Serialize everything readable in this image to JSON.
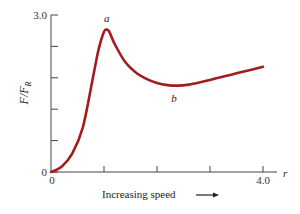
{
  "chart_data": {
    "type": "line",
    "title": "",
    "xlabel": "Increasing speed",
    "xlabel_arrow": "→",
    "x_axis_symbol": "r",
    "ylabel": "F/F_R",
    "ylabel_main": "F/F",
    "ylabel_sub": "R",
    "xlim": [
      0,
      4.0
    ],
    "ylim": [
      0,
      3.0
    ],
    "x_tick_labels": [
      "0",
      "",
      "",
      "",
      "4.0"
    ],
    "x_ticks": [
      0,
      1,
      2,
      3,
      4
    ],
    "y_tick_labels": [
      "0",
      "",
      "",
      "",
      "",
      "3.0"
    ],
    "y_ticks": [
      0,
      0.6,
      1.2,
      1.8,
      2.4,
      3.0
    ],
    "grid": false,
    "legend": null,
    "color": "#a31a1f",
    "annotations": [
      {
        "label": "a",
        "x": 1.05,
        "y": 2.72,
        "note": "peak"
      },
      {
        "label": "b",
        "x": 2.3,
        "y": 1.64,
        "note": "minimum"
      }
    ],
    "series": [
      {
        "name": "F/F_R",
        "x": [
          0,
          0.2,
          0.4,
          0.6,
          0.8,
          0.9,
          1.0,
          1.05,
          1.1,
          1.2,
          1.4,
          1.6,
          1.8,
          2.0,
          2.2,
          2.4,
          2.6,
          2.8,
          3.0,
          3.2,
          3.4,
          3.6,
          3.8,
          4.0
        ],
        "values": [
          0,
          0.1,
          0.35,
          0.85,
          1.85,
          2.35,
          2.68,
          2.72,
          2.68,
          2.45,
          2.1,
          1.9,
          1.78,
          1.7,
          1.66,
          1.65,
          1.67,
          1.71,
          1.76,
          1.81,
          1.86,
          1.91,
          1.96,
          2.01
        ]
      }
    ]
  }
}
